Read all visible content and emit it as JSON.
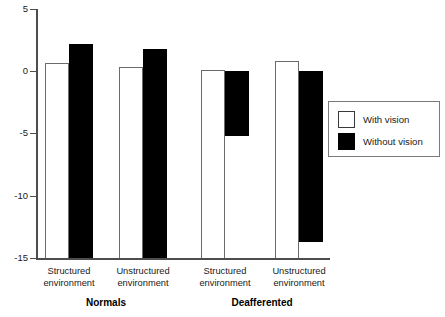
{
  "chart_data": {
    "type": "bar",
    "title": "",
    "subtitle": "",
    "xlabel": "",
    "ylabel": "",
    "ylim": [
      -15,
      5
    ],
    "yticks": [
      5,
      0,
      -5,
      -10,
      -15
    ],
    "ytick_labels": [
      "5",
      "0",
      "-5",
      "-10",
      "-15"
    ],
    "grid": false,
    "legend_position": "right",
    "categories": [
      "Structured environment",
      "Unstructured environment",
      "Structured environment",
      "Unstructured environment"
    ],
    "category_lines": [
      [
        "Structured",
        "environment"
      ],
      [
        "Unstructured",
        "environment"
      ],
      [
        "Structured",
        "environment"
      ],
      [
        "Unstructured",
        "environment"
      ]
    ],
    "groups": [
      "Normals",
      "Deafferented"
    ],
    "group_spans": [
      2,
      2
    ],
    "series": [
      {
        "name": "With vision",
        "color": "#ffffff",
        "edge_color": "#6b6b6b",
        "values": [
          0.7,
          0.35,
          0.1,
          0.8
        ]
      },
      {
        "name": "Without vision",
        "color": "#000000",
        "edge_color": "#000000",
        "values": [
          2.2,
          1.8,
          -5.2,
          -13.7
        ]
      }
    ],
    "annotations": []
  },
  "axis": {
    "ticks": [
      {
        "label": "5",
        "value": 5
      },
      {
        "label": "0",
        "value": 0
      },
      {
        "label": "-5",
        "value": -5
      },
      {
        "label": "-10",
        "value": -10
      },
      {
        "label": "-15",
        "value": -15
      }
    ]
  },
  "legend": {
    "items": [
      {
        "label": "With vision",
        "swatch": "open"
      },
      {
        "label": "Without vision",
        "swatch": "filled"
      }
    ]
  },
  "categories": [
    {
      "line1": "Structured",
      "line2": "environment"
    },
    {
      "line1": "Unstructured",
      "line2": "environment"
    },
    {
      "line1": "Structured",
      "line2": "environment"
    },
    {
      "line1": "Unstructured",
      "line2": "environment"
    }
  ],
  "groups": [
    {
      "label": "Normals"
    },
    {
      "label": "Deafferented"
    }
  ],
  "colors": {
    "with_vision": "#ffffff",
    "without_vision": "#000000",
    "axis": "#4d4d4d",
    "outline": "#6b6b6b",
    "text": "#1a1a1a",
    "background": "#ffffff"
  }
}
